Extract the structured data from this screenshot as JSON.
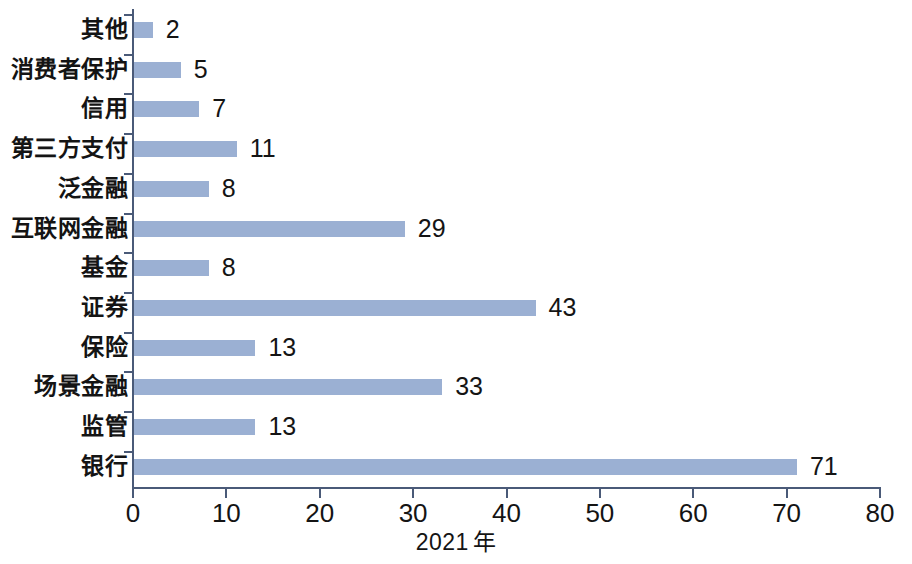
{
  "chart_data": {
    "type": "bar",
    "orientation": "horizontal",
    "title": "",
    "subtitle": "",
    "xlabel": "2021 年",
    "ylabel": "",
    "xlim": [
      0,
      80
    ],
    "xticks": [
      0,
      10,
      20,
      30,
      40,
      50,
      60,
      70,
      80
    ],
    "xtick_labels": [
      "0",
      "10",
      "20",
      "30",
      "40",
      "50",
      "60",
      "70",
      "80"
    ],
    "grid": false,
    "legend": null,
    "bar_color": "#9bb0d3",
    "axis_color": "#4a5a78",
    "categories": [
      "其他",
      "消费者保护",
      "信用",
      "第三方支付",
      "泛金融",
      "互联网金融",
      "基金",
      "证券",
      "保险",
      "场景金融",
      "监管",
      "银行"
    ],
    "values": [
      2,
      5,
      7,
      11,
      8,
      29,
      8,
      43,
      13,
      33,
      13,
      71
    ],
    "value_labels": [
      "2",
      "5",
      "7",
      "11",
      "8",
      "29",
      "8",
      "43",
      "13",
      "33",
      "13",
      "71"
    ]
  },
  "axis_title_parts": {
    "year": "2021",
    "unit": "年"
  }
}
